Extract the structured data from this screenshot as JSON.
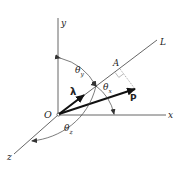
{
  "figure": {
    "axes": {
      "x_label": "x",
      "y_label": "y",
      "z_label": "z"
    },
    "origin_label": "O",
    "line_label": "L",
    "point_label": "A",
    "force_label": "P",
    "unit_vector_label": "λ",
    "angles": {
      "theta_x": {
        "symbol": "θ",
        "sub": "x"
      },
      "theta_y": {
        "symbol": "θ",
        "sub": "y"
      },
      "theta_z": {
        "symbol": "θ",
        "sub": "z"
      }
    },
    "colors": {
      "line": "#555555",
      "vector": "#1a1a1a",
      "background": "#ffffff"
    }
  }
}
